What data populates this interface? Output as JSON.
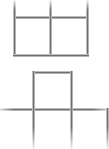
{
  "page": {
    "title": "Matchstick puzzle figures",
    "background_color": "#ffffff",
    "width": 109,
    "height": 149,
    "stick_color": "#6f6f6f",
    "stick_highlight_color": "#f2f2f2",
    "stick_thickness": 3
  },
  "figures": [
    {
      "id": "figure-top",
      "name": "two-squares-row",
      "description": "Row of two adjoining squares, top edge cropped by image border",
      "squares_visible": 2,
      "bounds": {
        "x": 13,
        "y": 0,
        "width": 76,
        "height": 57
      },
      "sticks": [
        {
          "name": "top-left-vertical",
          "orientation": "v",
          "x": 13,
          "y": 0,
          "length": 18
        },
        {
          "name": "top-middle-vertical",
          "orientation": "v",
          "x": 49,
          "y": 0,
          "length": 18
        },
        {
          "name": "top-right-vertical",
          "orientation": "v",
          "x": 86,
          "y": 0,
          "length": 18
        },
        {
          "name": "middle-horizontal-left",
          "orientation": "h",
          "x": 13,
          "y": 16,
          "length": 37
        },
        {
          "name": "middle-horizontal-right",
          "orientation": "h",
          "x": 49,
          "y": 16,
          "length": 40
        },
        {
          "name": "lower-left-vertical",
          "orientation": "v",
          "x": 13,
          "y": 16,
          "length": 40
        },
        {
          "name": "lower-middle-vertical",
          "orientation": "v",
          "x": 49,
          "y": 16,
          "length": 40
        },
        {
          "name": "lower-right-vertical",
          "orientation": "v",
          "x": 86,
          "y": 16,
          "length": 40
        },
        {
          "name": "bottom-horizontal-left",
          "orientation": "h",
          "x": 13,
          "y": 54,
          "length": 37
        },
        {
          "name": "bottom-horizontal-right",
          "orientation": "h",
          "x": 49,
          "y": 54,
          "length": 40
        }
      ]
    },
    {
      "id": "figure-bottom",
      "name": "t-shape-squares",
      "description": "T / cross arrangement: one square on top centered over a horizontal row, lower squares cropped by bottom image border",
      "squares_visible": 3,
      "bounds": {
        "x": 0,
        "y": 71,
        "width": 109,
        "height": 78
      },
      "sticks": [
        {
          "name": "upper-square-top",
          "orientation": "h",
          "x": 32,
          "y": 71,
          "length": 41
        },
        {
          "name": "upper-square-left",
          "orientation": "v",
          "x": 32,
          "y": 71,
          "length": 40
        },
        {
          "name": "upper-square-right",
          "orientation": "v",
          "x": 70,
          "y": 71,
          "length": 40
        },
        {
          "name": "row-horizontal-left",
          "orientation": "h",
          "x": 0,
          "y": 108,
          "length": 33
        },
        {
          "name": "row-horizontal-mid",
          "orientation": "h",
          "x": 32,
          "y": 108,
          "length": 41
        },
        {
          "name": "row-horizontal-right",
          "orientation": "h",
          "x": 70,
          "y": 108,
          "length": 39
        },
        {
          "name": "lower-left-vertical",
          "orientation": "v",
          "x": 32,
          "y": 108,
          "length": 41
        },
        {
          "name": "lower-right-vertical",
          "orientation": "v",
          "x": 70,
          "y": 108,
          "length": 41
        },
        {
          "name": "lower-far-right-vertical",
          "orientation": "v",
          "x": 106,
          "y": 108,
          "length": 41
        }
      ]
    }
  ]
}
